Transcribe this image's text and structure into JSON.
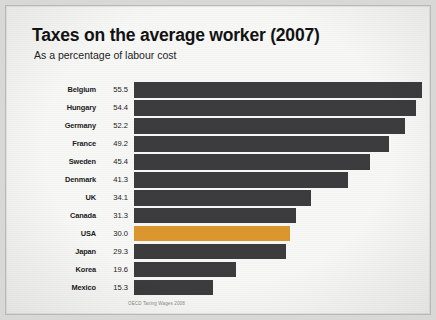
{
  "chart_data": {
    "type": "bar",
    "orientation": "horizontal",
    "title": "Taxes on the average worker (2007)",
    "subtitle": "As a percentage of labour cost",
    "xlabel": "",
    "ylabel": "",
    "xlim": [
      0,
      55.5
    ],
    "grid": false,
    "legend": "none",
    "source": "OECD Taxing Wages 2008",
    "categories": [
      "Belgium",
      "Hungary",
      "Germany",
      "France",
      "Sweden",
      "Denmark",
      "UK",
      "Canada",
      "USA",
      "Japan",
      "Korea",
      "Mexico"
    ],
    "values": [
      55.5,
      54.4,
      52.2,
      49.2,
      45.4,
      41.3,
      34.1,
      31.3,
      30.0,
      29.3,
      19.6,
      15.3
    ],
    "value_labels": [
      "55.5",
      "54.4",
      "52.2",
      "49.2",
      "45.4",
      "41.3",
      "34.1",
      "31.3",
      "30.0",
      "29.3",
      "19.6",
      "15.3"
    ],
    "highlight_category": "USA",
    "bar_color": "#3c3c3e",
    "highlight_color": "#e09a2e",
    "background_color": "#fdfdfc",
    "bars": [
      {
        "label": "Belgium",
        "value": 55.5,
        "value_label": "55.5",
        "highlight": false
      },
      {
        "label": "Hungary",
        "value": 54.4,
        "value_label": "54.4",
        "highlight": false
      },
      {
        "label": "Germany",
        "value": 52.2,
        "value_label": "52.2",
        "highlight": false
      },
      {
        "label": "France",
        "value": 49.2,
        "value_label": "49.2",
        "highlight": false
      },
      {
        "label": "Sweden",
        "value": 45.4,
        "value_label": "45.4",
        "highlight": false
      },
      {
        "label": "Denmark",
        "value": 41.3,
        "value_label": "41.3",
        "highlight": false
      },
      {
        "label": "UK",
        "value": 34.1,
        "value_label": "34.1",
        "highlight": false
      },
      {
        "label": "Canada",
        "value": 31.3,
        "value_label": "31.3",
        "highlight": false
      },
      {
        "label": "USA",
        "value": 30.0,
        "value_label": "30.0",
        "highlight": true
      },
      {
        "label": "Japan",
        "value": 29.3,
        "value_label": "29.3",
        "highlight": false
      },
      {
        "label": "Korea",
        "value": 19.6,
        "value_label": "19.6",
        "highlight": false
      },
      {
        "label": "Mexico",
        "value": 15.3,
        "value_label": "15.3",
        "highlight": false
      }
    ]
  }
}
